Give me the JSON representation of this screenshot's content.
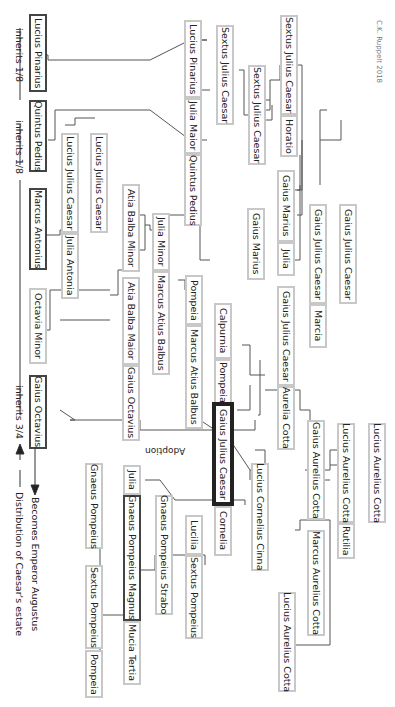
{
  "credit": "C.K. Ruppelt 2018",
  "people": {
    "sextus_jc_1": "Sextus Julius Caesar",
    "horatio": "Horatio",
    "sextus_jc_2": "Sextus Julius Caesar",
    "sextus_jc_3": "Sextus Julius Caesar",
    "lucius_pinarius_1": "Lucius Pinarius",
    "julia_maior": "Julia Maior",
    "quintus_pedius_1": "Quintus Pedius",
    "lucius_pinarius_heir": "Lucius Pinarius",
    "quintus_pedius_heir": "Quintus Pedius",
    "lucius_jc_1": "Lucius Julius Caesar",
    "lucius_jc_2": "Lucius Julius Caesar",
    "marcus_antonius": "Marcus Antonius",
    "julia_antonia": "Julia Antonia",
    "gaius_jc_grand": "Gaius Julius Caesar",
    "gaius_jc_father": "Gaius Julius Caesar",
    "marcia": "Marcia",
    "gaius_marius_1": "Gaius Marius",
    "julia": "Julia",
    "gaius_marius_2": "Gaius Marius",
    "atia_balba_minor": "Atia Balba Minor",
    "julia_minor": "Julia Minor",
    "marcus_atius_balbus_1": "Marcus Atius Balbus",
    "atia_balba_maior": "Atia Balba Maior",
    "gaius_octavius_father": "Gaius Octavius",
    "pompeia_1": "Pompeia",
    "marcus_atius_balbus_2": "Marcus Atius Balbus",
    "calpurnia": "Calpurnia",
    "pompeia_2": "Pompeia",
    "gaius_jc_dictator": "Gaius Julius Caesar",
    "cornelia": "Cornelia",
    "gaius_jc_3": "Gaius Julius Caesar",
    "aurelia_cotta": "Aurelia Cotta",
    "octavia_minor": "Octavia Minor",
    "gaius_octavius_heir": "Gaius Octavius",
    "lucius_aurelius_cotta_1": "Lucius Aurelius Cotta",
    "lucius_aurelius_cotta_2": "Lucius Aurelius Cotta",
    "rutilia": "Rutilia",
    "gaius_aurelius_cotta": "Gaius Aurelius Cotta",
    "marcus_aurelius_cotta": "Marcus Aurelius Cotta",
    "lucius_aurelius_cotta_3": "Lucius Aurelius Cotta",
    "lucius_cornelius_cinna": "Lucius Cornelius Cinna",
    "lucilia": "Lucilia",
    "sextus_pompeius_1": "Sextus Pompeius",
    "gnaeus_pompeius_strabo": "Gnaeus Pompeius Strabo",
    "julia_2": "Julia",
    "gnaeus_pompeius_magnus": "Gnaeus Pompeius Magnus",
    "mucia_tertia": "Mucia Tertia",
    "gnaeus_pompeius": "Gnaeus Pompeius",
    "sextus_pompeius_2": "Sextus Pompeius",
    "pompeia_3": "Pompeia"
  },
  "annotations": {
    "inherits_pinarius": "inherits 1/8",
    "inherits_pedius": "inherits 1/8",
    "inherits_octavius": "inherits 3/4",
    "adoption": "Adoption",
    "legend_augustus": "Becomes Emperor Augustus",
    "legend_estate": "Distribution of Caesar's estate"
  }
}
